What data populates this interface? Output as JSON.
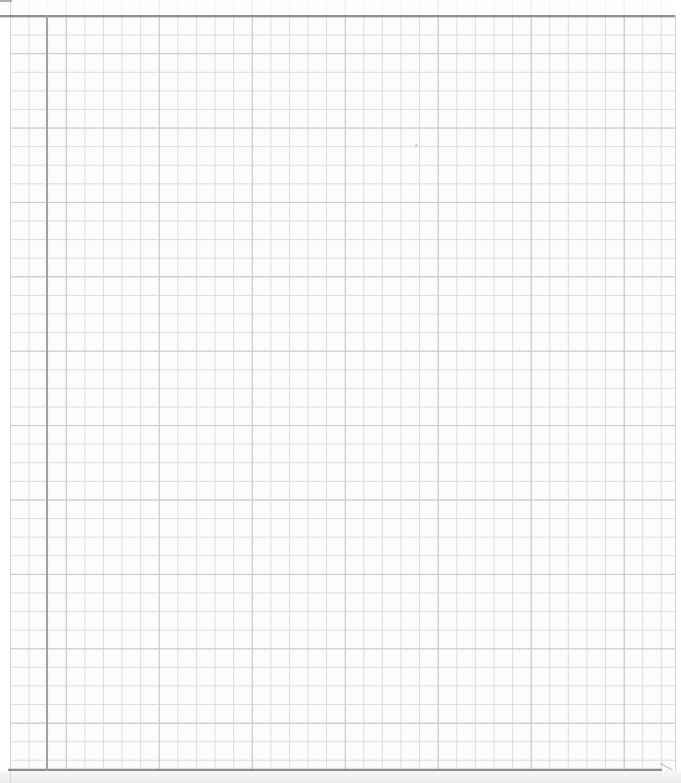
{
  "colors": {
    "scan_background": "#ffffff",
    "paper": "#fcfcfa",
    "grid_line": "#dcdce1",
    "grid_line_accent": "#c9c9d2",
    "edge_line_dark": "#8e8e91",
    "margin_line": "#a0a0a6",
    "paper_edge_faint": "#d6d6da",
    "below_page": "#f6f6f6",
    "edge_tail": "#b5b5b8",
    "corner_artifact": "#b0b0b4",
    "speck": "#cfcfd4"
  },
  "grid": {
    "cell_size_px": 18.6,
    "offset_x_px": 10,
    "offset_y_px": 16,
    "accent_period_x_cells": 5,
    "accent_period_y_cells": 4
  },
  "page": {
    "width_px": 681,
    "height_px": 783,
    "left_strip_width_px": 10,
    "right_strip_x_px": 676,
    "top_fade_height_px": 15,
    "below_strip_y_px": 771
  },
  "lines": {
    "top_edge": {
      "x": 0,
      "y": 15,
      "width": 675,
      "height": 2
    },
    "bottom_edge": {
      "x": 8,
      "y": 769,
      "width": 654,
      "height": 2
    },
    "bottom_tail": {
      "x": 660,
      "y": 763,
      "width": 14
    },
    "margin": {
      "x": 46,
      "y": 15,
      "width": 2,
      "height": 756
    },
    "left_paper_edge": {
      "x": 10
    },
    "right_paper_edge": {
      "x": 675,
      "height": 756
    }
  },
  "artifacts": {
    "speck": {
      "x": 415,
      "y": 144
    },
    "corner_mark": {
      "x": 0,
      "y": 0,
      "width": 12
    }
  }
}
